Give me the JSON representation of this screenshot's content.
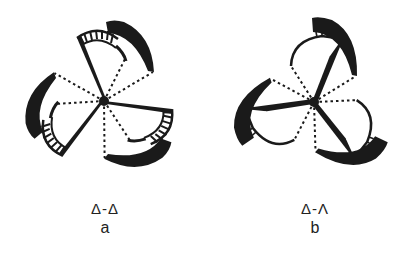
{
  "figure": {
    "panels": [
      {
        "id": "a",
        "configuration": "Δ-Δ",
        "label": "a",
        "blades": 3,
        "center": [
          104,
          101
        ]
      },
      {
        "id": "b",
        "configuration": "Δ-Λ",
        "label": "b",
        "blades": 3,
        "center": [
          314,
          102
        ]
      }
    ],
    "colors": {
      "ink": "#1a1a1a",
      "background": "#ffffff"
    }
  }
}
